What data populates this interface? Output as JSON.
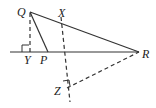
{
  "diagram": {
    "type": "geometry",
    "points": {
      "Q": {
        "label": "Q",
        "x": 30,
        "y": 12
      },
      "X": {
        "label": "X",
        "x": 61,
        "y": 17
      },
      "P": {
        "label": "P",
        "x": 48,
        "y": 52
      },
      "R": {
        "label": "R",
        "x": 139,
        "y": 52
      },
      "Y": {
        "label": "Y",
        "x": 30,
        "y": 52
      },
      "Z": {
        "label": "Z",
        "x": 66,
        "y": 87
      }
    },
    "labels": {
      "Q": "Q",
      "X": "X",
      "P": "P",
      "R": "R",
      "Y": "Y",
      "Z": "Z"
    },
    "segments": [
      {
        "from": "Q",
        "to": "R",
        "style": "solid"
      },
      {
        "from": "Q",
        "to": "P",
        "style": "solid"
      },
      {
        "from": "line-start",
        "to": "R",
        "style": "solid"
      },
      {
        "from": "Q",
        "to": "Y",
        "style": "dashed"
      },
      {
        "from": "X",
        "to": "Z",
        "style": "dashed"
      },
      {
        "from": "Z",
        "to": "R",
        "style": "dashed"
      }
    ],
    "right_angles": [
      "Y",
      "Z"
    ],
    "colors": {
      "stroke": "#333333",
      "label": "#222222"
    }
  }
}
